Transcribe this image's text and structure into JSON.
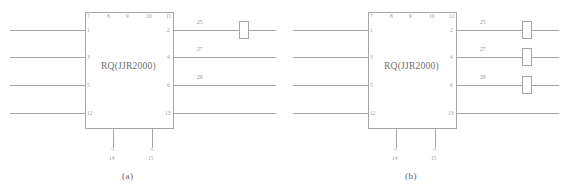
{
  "figure": {
    "background_color": "#ffffff",
    "line_color": "#9b9b9b",
    "text_color": "#8a8a8a",
    "panels": [
      {
        "caption": "(a)",
        "block_label": "RQ(JJR2000)",
        "top_pins": [
          "7",
          "8",
          "9",
          "10",
          "11"
        ],
        "left_pins": [
          "1",
          "3",
          "5",
          "12"
        ],
        "right_pins": [
          "2",
          "4",
          "6",
          "13"
        ],
        "bottom_pins": [
          "14",
          "15"
        ],
        "bottom_marks": [
          "%",
          "%"
        ],
        "wire_labels": [
          "25",
          "27",
          "29"
        ],
        "contacts": [
          {
            "on_right_pin": "2",
            "present": true
          },
          {
            "on_right_pin": "4",
            "present": false
          },
          {
            "on_right_pin": "6",
            "present": false
          }
        ],
        "contact_count": 1
      },
      {
        "caption": "(b)",
        "block_label": "RQ(JJR2000)",
        "top_pins": [
          "7",
          "8",
          "9",
          "10",
          "11"
        ],
        "left_pins": [
          "1",
          "3",
          "5",
          "12"
        ],
        "right_pins": [
          "2",
          "4",
          "6",
          "13"
        ],
        "bottom_pins": [
          "14",
          "15"
        ],
        "bottom_marks": [
          "%",
          "%"
        ],
        "wire_labels": [
          "25",
          "27",
          "29"
        ],
        "contacts": [
          {
            "on_right_pin": "2",
            "present": true
          },
          {
            "on_right_pin": "4",
            "present": true
          },
          {
            "on_right_pin": "6",
            "present": true
          }
        ],
        "contact_count": 3
      }
    ]
  }
}
